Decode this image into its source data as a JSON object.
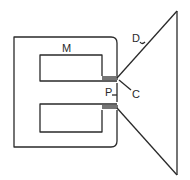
{
  "diagram": {
    "type": "loudspeaker-schematic",
    "labels": {
      "magnet": "M",
      "pole": "P",
      "coil": "C",
      "diaphragm": "D"
    },
    "colors": {
      "stroke": "#2a2a2a",
      "background": "#ffffff"
    }
  }
}
